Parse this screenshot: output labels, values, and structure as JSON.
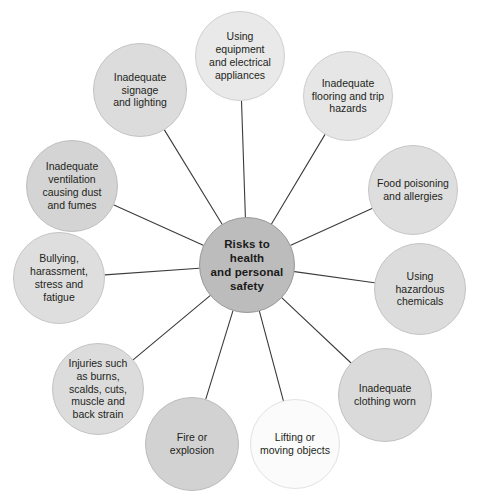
{
  "diagram": {
    "type": "radial-hub-and-spoke",
    "title": "Risks to health and personal safety",
    "canvas": {
      "width": 480,
      "height": 498,
      "background": "#ffffff"
    },
    "connector_color": "#3b3b3f",
    "connector_width": 1.1,
    "hub": {
      "id": "hub",
      "label": "Risks to health\nand personal\nsafety",
      "cx": 247,
      "cy": 265,
      "r": 48,
      "fill": "#bcbcbc",
      "stroke": "#9a9a9a",
      "text_color": "#1a1a1a"
    },
    "nodes": [
      {
        "id": "using-equipment-and-electrical-appliances",
        "label": "Using equipment\nand electrical\nappliances",
        "cx": 240,
        "cy": 56,
        "r": 45,
        "fill": "#e9e9e9",
        "stroke": "#cfcfcf"
      },
      {
        "id": "inadequate-flooring-and-trip-hazards",
        "label": "Inadequate\nflooring and trip\nhazards",
        "cx": 348,
        "cy": 96,
        "r": 45,
        "fill": "#e6e6e6",
        "stroke": "#cdcdcd"
      },
      {
        "id": "food-poisoning-and-allergies",
        "label": "Food poisoning\nand allergies",
        "cx": 413,
        "cy": 190,
        "r": 45,
        "fill": "#dedede",
        "stroke": "#c6c6c6"
      },
      {
        "id": "using-hazardous-chemicals",
        "label": "Using hazardous\nchemicals",
        "cx": 420,
        "cy": 289,
        "r": 46,
        "fill": "#dcdcdc",
        "stroke": "#c4c4c4"
      },
      {
        "id": "inadequate-clothing-worn",
        "label": "Inadequate\nclothing worn",
        "cx": 385,
        "cy": 395,
        "r": 47,
        "fill": "#dadada",
        "stroke": "#c2c2c2"
      },
      {
        "id": "lifting-or-moving-objects",
        "label": "Lifting or\nmoving objects",
        "cx": 295,
        "cy": 444,
        "r": 45,
        "fill": "#fbfbfb",
        "stroke": "#e2e2e2"
      },
      {
        "id": "fire-or-explosion",
        "label": "Fire or\nexplosion",
        "cx": 192,
        "cy": 444,
        "r": 47,
        "fill": "#d2d2d2",
        "stroke": "#bdbdbd"
      },
      {
        "id": "injuries-such-as-burns-scalds-cuts-muscle-and-back-strain",
        "label": "Injuries such\nas burns,\nscalds, cuts,\nmuscle and\nback strain",
        "cx": 98,
        "cy": 389,
        "r": 46,
        "fill": "#dcdcdc",
        "stroke": "#c4c4c4"
      },
      {
        "id": "bullying-harassment-stress-and-fatigue",
        "label": "Bullying,\nharassment,\nstress and fatigue",
        "cx": 59,
        "cy": 278,
        "r": 46,
        "fill": "#dedede",
        "stroke": "#c6c6c6"
      },
      {
        "id": "inadequate-ventilation-causing-dust-and-fumes",
        "label": "Inadequate\nventilation\ncausing dust\nand fumes",
        "cx": 72,
        "cy": 186,
        "r": 46,
        "fill": "#d4d4d4",
        "stroke": "#bfbfbf"
      },
      {
        "id": "inadequate-signage-and-lighting",
        "label": "Inadequate\nsignage\nand lighting",
        "cx": 140,
        "cy": 90,
        "r": 47,
        "fill": "#dcdcdc",
        "stroke": "#c4c4c4"
      }
    ]
  }
}
